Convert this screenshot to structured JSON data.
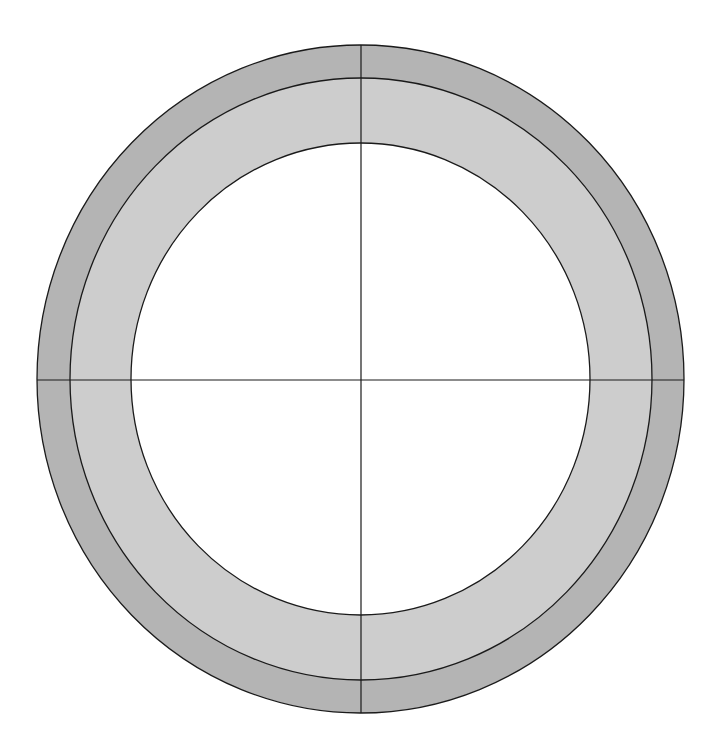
{
  "diagram": {
    "type": "concentric-rings-with-crosshair",
    "canvas": {
      "width": 719,
      "height": 756,
      "background": "#ffffff"
    },
    "stroke": "#1a1a1a",
    "rings": [
      {
        "name": "outer-ring",
        "cx": 360.5,
        "cy": 379,
        "rx": 323.5,
        "ry": 334,
        "fill": "#b4b4b4"
      },
      {
        "name": "middle-ring",
        "cx": 361,
        "cy": 379,
        "rx": 291,
        "ry": 301,
        "fill": "#cdcdcd"
      },
      {
        "name": "inner-disk",
        "cx": 360.5,
        "cy": 379,
        "rx": 229.5,
        "ry": 236,
        "fill": "#ffffff"
      }
    ],
    "axes": {
      "vertical": {
        "x": 361,
        "y1": 45,
        "y2": 713
      },
      "horizontal": {
        "y": 380,
        "x1": 37,
        "x2": 684
      }
    }
  }
}
